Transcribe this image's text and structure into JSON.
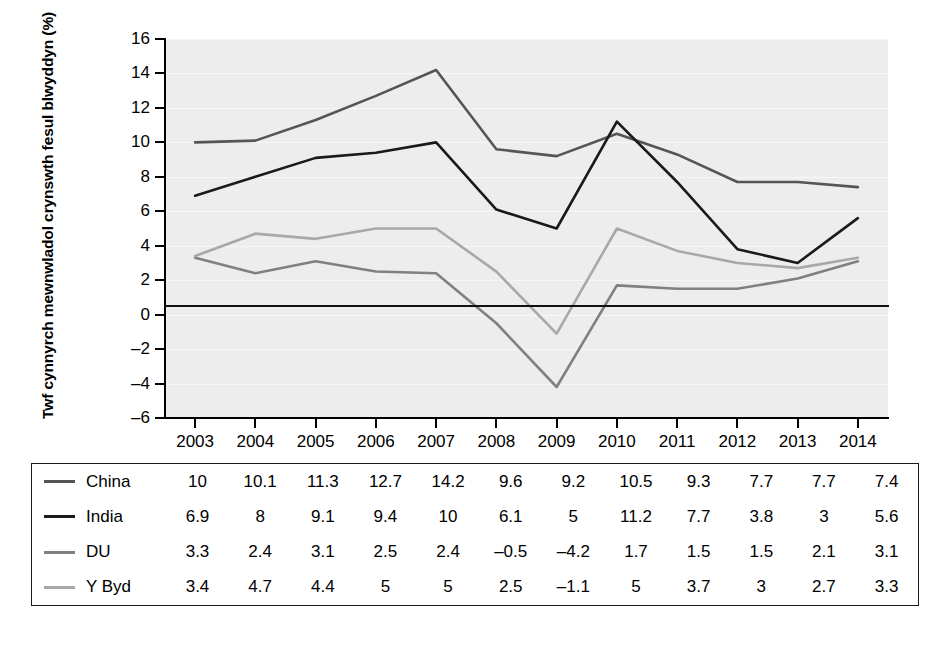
{
  "chart_data": {
    "type": "line",
    "title": "",
    "xlabel": "",
    "ylabel": "Twf cynnyrch mewnwladol crynswth fesul blwyddyn (%)",
    "categories": [
      "2003",
      "2004",
      "2005",
      "2006",
      "2007",
      "2008",
      "2009",
      "2010",
      "2011",
      "2012",
      "2013",
      "2014"
    ],
    "x": [
      2003,
      2004,
      2005,
      2006,
      2007,
      2008,
      2009,
      2010,
      2011,
      2012,
      2013,
      2014
    ],
    "ylim": [
      -6,
      16
    ],
    "yticks": [
      16,
      14,
      12,
      10,
      8,
      6,
      4,
      2,
      0,
      -2,
      -4,
      -6
    ],
    "ytick_labels": [
      "16",
      "14",
      "12",
      "10",
      "8",
      "6",
      "4",
      "2",
      "0",
      "–2",
      "–4",
      "–6"
    ],
    "grid": true,
    "legend_position": "table-below",
    "zero_line": 0,
    "series": [
      {
        "name": "China",
        "color": "#555555",
        "values": [
          10,
          10.1,
          11.3,
          12.7,
          14.2,
          9.6,
          9.2,
          10.5,
          9.3,
          7.7,
          7.7,
          7.4
        ],
        "labels": [
          "10",
          "10.1",
          "11.3",
          "12.7",
          "14.2",
          "9.6",
          "9.2",
          "10.5",
          "9.3",
          "7.7",
          "7.7",
          "7.4"
        ]
      },
      {
        "name": "India",
        "color": "#1a1a1a",
        "values": [
          6.9,
          8,
          9.1,
          9.4,
          10,
          6.1,
          5,
          11.2,
          7.7,
          3.8,
          3,
          5.6
        ],
        "labels": [
          "6.9",
          "8",
          "9.1",
          "9.4",
          "10",
          "6.1",
          "5",
          "11.2",
          "7.7",
          "3.8",
          "3",
          "5.6"
        ]
      },
      {
        "name": "DU",
        "color": "#808080",
        "values": [
          3.3,
          2.4,
          3.1,
          2.5,
          2.4,
          -0.5,
          -4.2,
          1.7,
          1.5,
          1.5,
          2.1,
          3.1
        ],
        "labels": [
          "3.3",
          "2.4",
          "3.1",
          "2.5",
          "2.4",
          "–0.5",
          "–4.2",
          "1.7",
          "1.5",
          "1.5",
          "2.1",
          "3.1"
        ]
      },
      {
        "name": "Y Byd",
        "color": "#a8a8a8",
        "values": [
          3.4,
          4.7,
          4.4,
          5,
          5,
          2.5,
          -1.1,
          5,
          3.7,
          3,
          2.7,
          3.3
        ],
        "labels": [
          "3.4",
          "4.7",
          "4.4",
          "5",
          "5",
          "2.5",
          "–1.1",
          "5",
          "3.7",
          "3",
          "2.7",
          "3.3"
        ]
      }
    ]
  },
  "plot": {
    "background_color": "#ededed",
    "gridline_color": "#f7f7f7",
    "axis_color": "#000000"
  },
  "table": {
    "border_color": "#1a1a1a",
    "background_color": "#ffffff"
  }
}
